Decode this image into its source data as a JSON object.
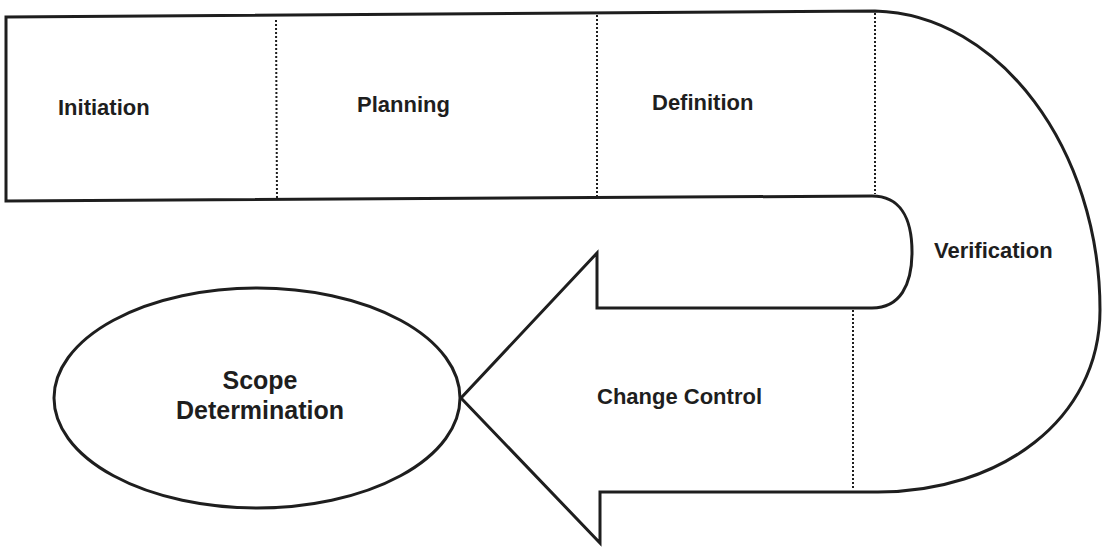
{
  "diagram": {
    "type": "scope-management-lifecycle",
    "phases": [
      {
        "id": "initiation",
        "label": "Initiation"
      },
      {
        "id": "planning",
        "label": "Planning"
      },
      {
        "id": "definition",
        "label": "Definition"
      },
      {
        "id": "verification",
        "label": "Verification"
      },
      {
        "id": "change-control",
        "label": "Change Control"
      }
    ],
    "outcome": {
      "label_line1": "Scope",
      "label_line2": "Determination"
    },
    "colors": {
      "stroke": "#1e1e1e",
      "fill": "#ffffff",
      "text": "#1e1e1e"
    }
  }
}
